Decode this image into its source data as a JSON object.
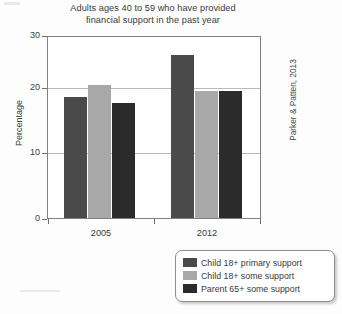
{
  "chart_data": {
    "type": "bar",
    "title": "Adults ages 40 to 59 who have provided financial support in the past year",
    "title_line1": "Adults ages 40 to 59 who have provided",
    "title_line2": "financial support in the past year",
    "xlabel": "",
    "ylabel": "Percentage",
    "ylim": [
      0,
      30
    ],
    "yticks": [
      0,
      10,
      20,
      30
    ],
    "ytick_labels": [
      "0",
      "10",
      "20",
      "30"
    ],
    "grid": true,
    "legend_position": "bottom-right",
    "source": "Parker & Patten, 2013",
    "categories": [
      "2005",
      "2012"
    ],
    "series": [
      {
        "name": "Child 18+ primary support",
        "color": "#4a4a4a",
        "values": [
          20,
          27
        ]
      },
      {
        "name": "Child 18+ some support",
        "color": "#a8a8a8",
        "values": [
          22,
          21
        ]
      },
      {
        "name": "Parent 65+ some support",
        "color": "#2b2b2b",
        "values": [
          19,
          21
        ]
      }
    ]
  },
  "axis": {
    "y_title": "Percentage",
    "tick_30": "30",
    "tick_20": "20",
    "tick_10": "10",
    "tick_0": "0",
    "cat_2005": "2005",
    "cat_2012": "2012"
  },
  "legend": {
    "items": [
      {
        "label": "Child 18+ primary support",
        "color": "#4a4a4a"
      },
      {
        "label": "Child 18+ some support",
        "color": "#a8a8a8"
      },
      {
        "label": "Parent 65+ some support",
        "color": "#2b2b2b"
      }
    ]
  },
  "credit": {
    "text": "Parker & Patten, 2013"
  }
}
